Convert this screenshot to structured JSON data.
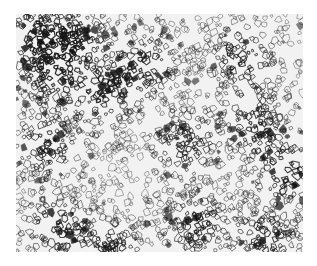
{
  "image": {
    "subject": "metallographic micrograph of polygonal grain structure",
    "palette": {
      "background": "#ffffff",
      "matrix": "#f2f2f2",
      "grain_boundary": "#1a1a1a",
      "dark_phase": "#0d0d0d"
    },
    "frame": {
      "x": 16,
      "y": 14,
      "width": 287,
      "height": 238
    }
  }
}
